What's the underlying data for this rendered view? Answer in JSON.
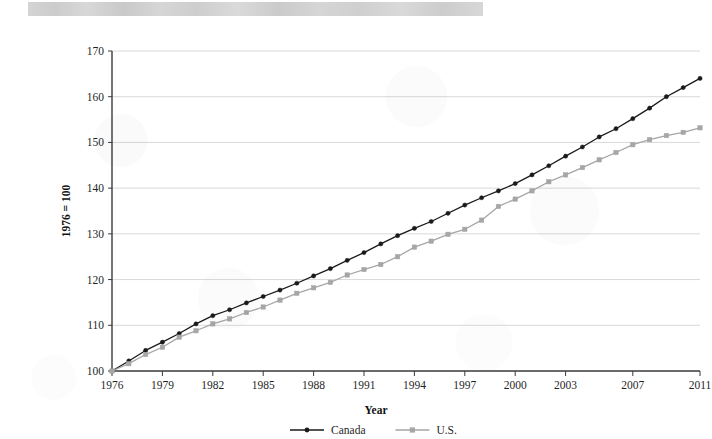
{
  "figure": {
    "title_band": "redacted-title-band"
  },
  "chart_data": {
    "type": "line",
    "title": "",
    "xlabel": "Year",
    "ylabel": "1976 = 100",
    "xlim": [
      1976,
      2011
    ],
    "ylim": [
      100,
      170
    ],
    "ytick_values": [
      100,
      110,
      120,
      130,
      140,
      150,
      160,
      170
    ],
    "ytick_labels": [
      "100",
      "110",
      "120",
      "130",
      "140",
      "150",
      "160",
      "170"
    ],
    "xtick_values": [
      1976,
      1979,
      1982,
      1985,
      1988,
      1991,
      1994,
      1997,
      2000,
      2003,
      2007,
      2011
    ],
    "xtick_labels": [
      "1976",
      "1979",
      "1982",
      "1985",
      "1988",
      "1991",
      "1994",
      "1997",
      "2000",
      "2003",
      "2007",
      "2011"
    ],
    "grid": "horizontal",
    "legend_position": "bottom-center",
    "x": [
      1976,
      1977,
      1978,
      1979,
      1980,
      1981,
      1982,
      1983,
      1984,
      1985,
      1986,
      1987,
      1988,
      1989,
      1990,
      1991,
      1992,
      1993,
      1994,
      1995,
      1996,
      1997,
      1998,
      1999,
      2000,
      2001,
      2002,
      2003,
      2004,
      2005,
      2006,
      2007,
      2008,
      2009,
      2010,
      2011
    ],
    "series": [
      {
        "name": "Canada",
        "color": "#1a1a1a",
        "marker": "circle",
        "values": [
          100.0,
          102.2,
          104.5,
          106.3,
          108.2,
          110.3,
          112.1,
          113.4,
          114.9,
          116.3,
          117.7,
          119.2,
          120.8,
          122.4,
          124.2,
          125.9,
          127.8,
          129.6,
          131.2,
          132.7,
          134.5,
          136.3,
          137.9,
          139.4,
          141.0,
          142.9,
          144.9,
          147.0,
          149.0,
          151.2,
          153.0,
          155.2,
          157.5,
          160.0,
          162.0,
          164.0
        ]
      },
      {
        "name": "U.S.",
        "color": "#a6a6a6",
        "marker": "square",
        "values": [
          100.0,
          101.6,
          103.6,
          105.2,
          107.4,
          108.8,
          110.3,
          111.4,
          112.8,
          114.0,
          115.5,
          117.0,
          118.2,
          119.4,
          121.0,
          122.2,
          123.3,
          125.0,
          127.1,
          128.4,
          129.9,
          131.0,
          133.0,
          136.0,
          137.6,
          139.4,
          141.4,
          142.9,
          144.5,
          146.2,
          147.8,
          149.5,
          150.6,
          151.5,
          152.2,
          153.2
        ]
      }
    ]
  },
  "legend": {
    "items": [
      {
        "label": "Canada",
        "color": "#1a1a1a",
        "marker": "circle"
      },
      {
        "label": "U.S.",
        "color": "#a6a6a6",
        "marker": "square"
      }
    ]
  }
}
